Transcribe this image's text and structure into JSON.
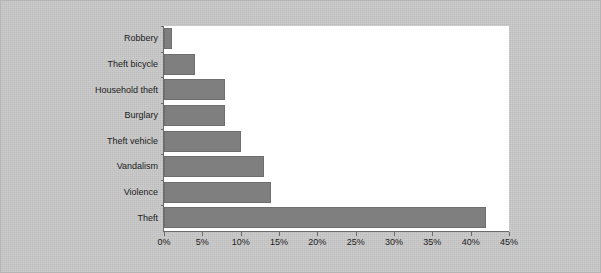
{
  "chart_data": {
    "type": "bar",
    "orientation": "horizontal",
    "title": "",
    "subtitle": "",
    "xlabel": "",
    "ylabel": "",
    "categories": [
      "Robbery",
      "Theft bicycle",
      "Household theft",
      "Burglary",
      "Theft vehicle",
      "Vandalism",
      "Violence",
      "Theft"
    ],
    "values": [
      1,
      4,
      8,
      8,
      10,
      13,
      14,
      42
    ],
    "value_unit": "%",
    "xlim": [
      0,
      45
    ],
    "xticks": [
      0,
      5,
      10,
      15,
      20,
      25,
      30,
      35,
      40,
      45
    ],
    "xtick_labels": [
      "0%",
      "5%",
      "10%",
      "15%",
      "20%",
      "25%",
      "30%",
      "35%",
      "40%",
      "45%"
    ],
    "grid": false,
    "legend": null,
    "annotations": [],
    "colors": {
      "bar_fill": "#7f7f7f",
      "bar_stroke": "#6e6e6e",
      "plot_background": "#ffffff",
      "figure_background": "#c9c9c9",
      "axis": "#6b6b6b",
      "text": "#1c1c1c"
    }
  }
}
